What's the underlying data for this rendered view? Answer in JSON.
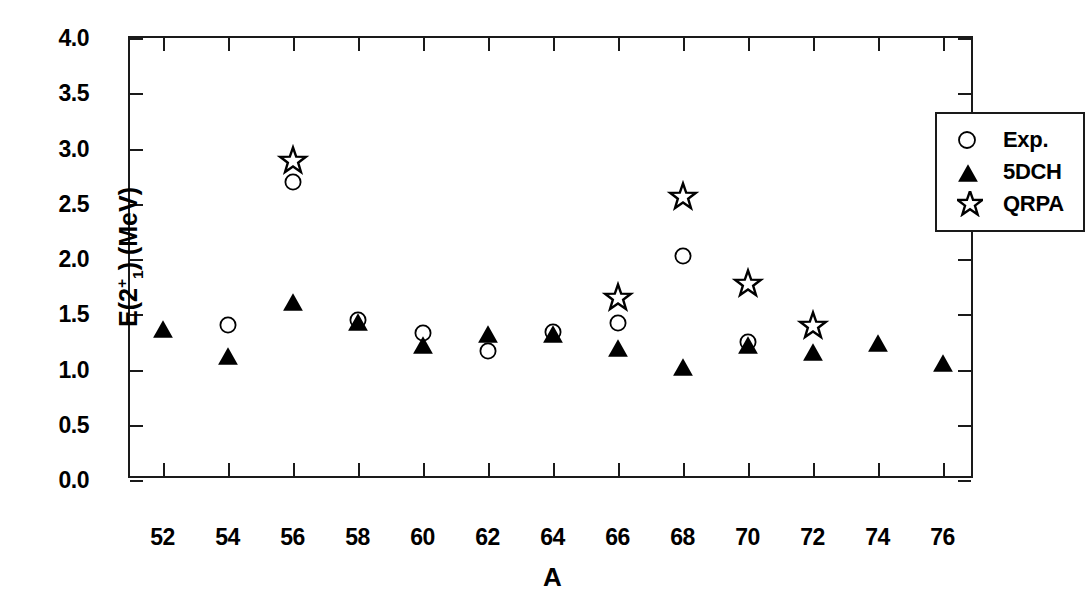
{
  "chart_data": {
    "type": "scatter",
    "title": "",
    "xlabel": "A",
    "ylabel": "E(2+1) (MeV)",
    "ylabel_parts": {
      "prefix": "E(2",
      "sup": "+",
      "sub": "1",
      "suffix": ") (MeV)"
    },
    "xlim": [
      51,
      77
    ],
    "ylim": [
      0.0,
      4.0
    ],
    "xticks": [
      52,
      54,
      56,
      58,
      60,
      62,
      64,
      66,
      68,
      70,
      72,
      74,
      76
    ],
    "xtick_labels": [
      "52",
      "54",
      "56",
      "58",
      "60",
      "62",
      "64",
      "66",
      "68",
      "70",
      "72",
      "74",
      "76"
    ],
    "yticks": [
      0.0,
      0.5,
      1.0,
      1.5,
      2.0,
      2.5,
      3.0,
      3.5,
      4.0
    ],
    "ytick_labels": [
      "0.0",
      "0.5",
      "1.0",
      "1.5",
      "2.0",
      "2.5",
      "3.0",
      "3.5",
      "4.0"
    ],
    "grid": false,
    "legend_position": "top-right",
    "x": [
      52,
      54,
      56,
      58,
      60,
      62,
      64,
      66,
      68,
      70,
      72,
      74,
      76
    ],
    "series": [
      {
        "name": "Exp.",
        "marker": "open-circle",
        "color": "#000000",
        "points": [
          {
            "x": 54,
            "y": 1.4
          },
          {
            "x": 56,
            "y": 2.7
          },
          {
            "x": 58,
            "y": 1.45
          },
          {
            "x": 60,
            "y": 1.33
          },
          {
            "x": 62,
            "y": 1.17
          },
          {
            "x": 64,
            "y": 1.34
          },
          {
            "x": 66,
            "y": 1.42
          },
          {
            "x": 68,
            "y": 2.03
          },
          {
            "x": 70,
            "y": 1.25
          }
        ]
      },
      {
        "name": "5DCH",
        "marker": "filled-triangle",
        "color": "#000000",
        "points": [
          {
            "x": 52,
            "y": 1.38
          },
          {
            "x": 54,
            "y": 1.13
          },
          {
            "x": 56,
            "y": 1.62
          },
          {
            "x": 58,
            "y": 1.44
          },
          {
            "x": 60,
            "y": 1.23
          },
          {
            "x": 62,
            "y": 1.33
          },
          {
            "x": 64,
            "y": 1.33
          },
          {
            "x": 66,
            "y": 1.2
          },
          {
            "x": 68,
            "y": 1.03
          },
          {
            "x": 70,
            "y": 1.23
          },
          {
            "x": 72,
            "y": 1.17
          },
          {
            "x": 74,
            "y": 1.25
          },
          {
            "x": 76,
            "y": 1.07
          }
        ]
      },
      {
        "name": "QRPA",
        "marker": "open-star",
        "color": "#000000",
        "points": [
          {
            "x": 56,
            "y": 2.89
          },
          {
            "x": 66,
            "y": 1.65
          },
          {
            "x": 68,
            "y": 2.56
          },
          {
            "x": 70,
            "y": 1.77
          },
          {
            "x": 72,
            "y": 1.39
          }
        ]
      }
    ]
  },
  "legend": {
    "items": [
      {
        "label": "Exp.",
        "marker": "open-circle"
      },
      {
        "label": "5DCH",
        "marker": "filled-triangle"
      },
      {
        "label": "QRPA",
        "marker": "open-star"
      }
    ]
  }
}
